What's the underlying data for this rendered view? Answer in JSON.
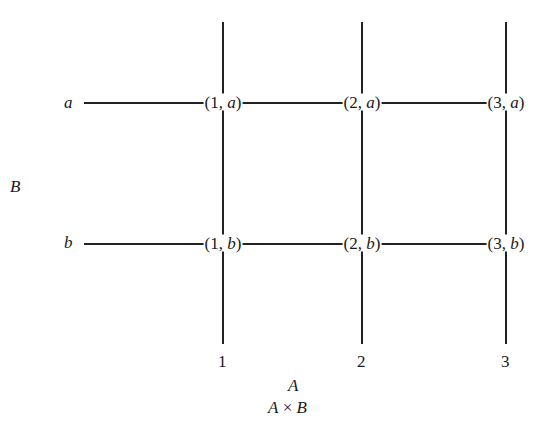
{
  "diagram": {
    "set_a_label": "A",
    "set_b_label": "B",
    "product_label_left": "A",
    "product_label_op": "×",
    "product_label_right": "B",
    "a_elements": [
      "1",
      "2",
      "3"
    ],
    "b_elements": [
      "a",
      "b"
    ],
    "nodes": [
      {
        "num": "1",
        "letter": "a"
      },
      {
        "num": "2",
        "letter": "a"
      },
      {
        "num": "3",
        "letter": "a"
      },
      {
        "num": "1",
        "letter": "b"
      },
      {
        "num": "2",
        "letter": "b"
      },
      {
        "num": "3",
        "letter": "b"
      }
    ]
  }
}
